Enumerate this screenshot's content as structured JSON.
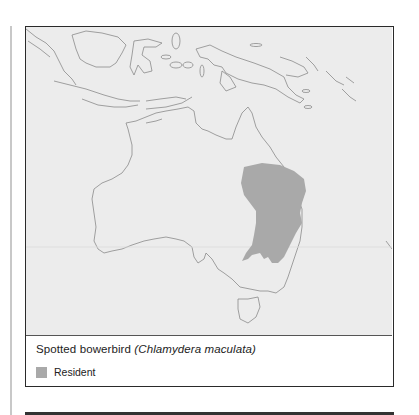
{
  "figure": {
    "caption": {
      "common_name": "Spotted bowerbird",
      "scientific_name": "(Chlamydera maculata)"
    },
    "legend": [
      {
        "label": "Resident",
        "color": "#a9a9a9"
      }
    ],
    "map": {
      "region": "Australia and surrounding islands",
      "background_color": "#ececec",
      "coastline_color": "#8a8a8a",
      "range_fill": "#a9a9a9"
    }
  }
}
